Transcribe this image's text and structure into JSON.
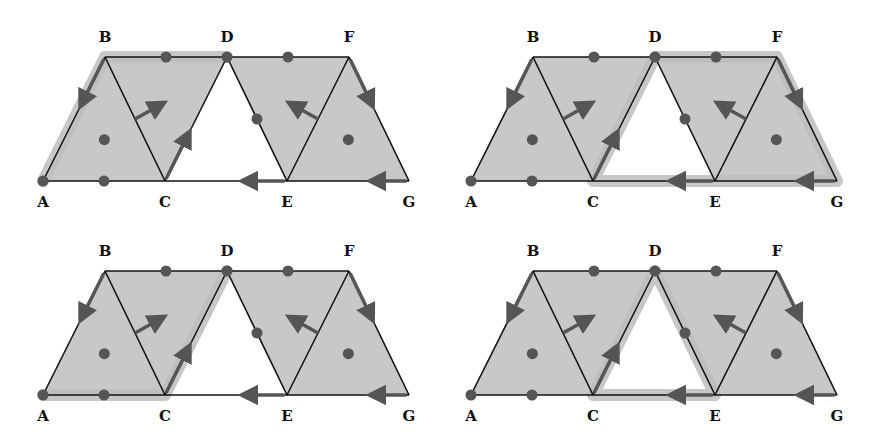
{
  "colors": {
    "fill": "#c8c8c8",
    "edge": "#111111",
    "highlight": "#bdbdbd",
    "arrow": "#555555",
    "dot": "#555555"
  },
  "vertices": [
    "A",
    "B",
    "C",
    "D",
    "E",
    "F",
    "G"
  ],
  "panels": [
    {
      "id": "top-left",
      "offset": [
        0,
        0
      ],
      "highlight_path": [
        "A",
        "B",
        "D"
      ],
      "labels": {
        "A": "A",
        "B": "B",
        "C": "C",
        "D": "D",
        "E": "E",
        "F": "F",
        "G": "G"
      }
    },
    {
      "id": "top-right",
      "offset": [
        428,
        0
      ],
      "highlight_path": [
        "C",
        "D",
        "F",
        "G",
        "C"
      ],
      "labels": {
        "A": "A",
        "B": "B",
        "C": "C",
        "D": "D",
        "E": "E",
        "F": "F",
        "G": "G"
      }
    },
    {
      "id": "bottom-left",
      "offset": [
        0,
        214
      ],
      "highlight_path": [
        "A",
        "C",
        "D"
      ],
      "labels": {
        "A": "A",
        "B": "B",
        "C": "C",
        "D": "D",
        "E": "E",
        "F": "F",
        "G": "G"
      }
    },
    {
      "id": "bottom-right",
      "offset": [
        428,
        214
      ],
      "highlight_path": [
        "C",
        "D",
        "E",
        "C"
      ],
      "labels": {
        "A": "A",
        "B": "B",
        "C": "C",
        "D": "D",
        "E": "E",
        "F": "F",
        "G": "G"
      }
    }
  ]
}
